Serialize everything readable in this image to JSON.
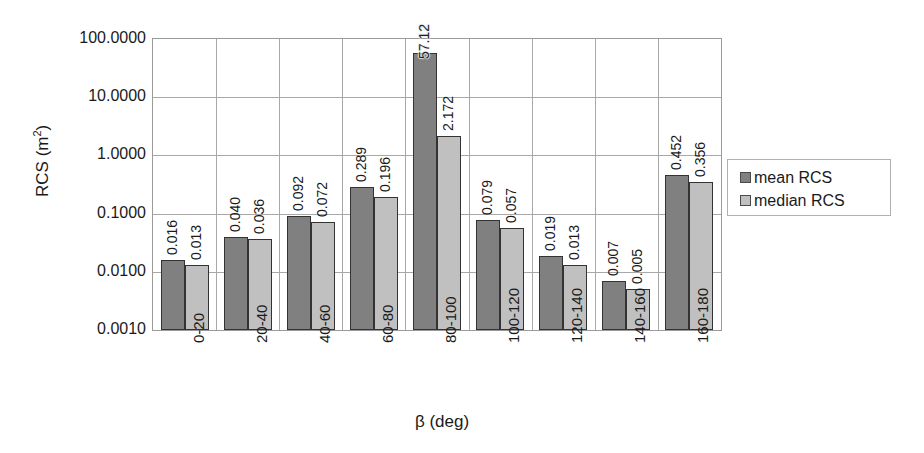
{
  "chart_data": {
    "type": "bar",
    "title": "",
    "xlabel": "β (deg)",
    "ylabel": "RCS (m²)",
    "ylabel_base": "RCS (m",
    "ylabel_sup": "2",
    "ylabel_tail": ")",
    "yscale": "log",
    "ylim": [
      0.001,
      100
    ],
    "grid": true,
    "legend_position": "right",
    "categories": [
      "0-20",
      "20-40",
      "40-60",
      "60-80",
      "80-100",
      "100-120",
      "120-140",
      "140-160",
      "160-180"
    ],
    "y_ticks": [
      "100.0000",
      "10.0000",
      "1.0000",
      "0.1000",
      "0.0100",
      "0.0010"
    ],
    "y_tick_values": [
      100,
      10,
      1,
      0.1,
      0.01,
      0.001
    ],
    "series": [
      {
        "name": "mean RCS",
        "color": "#808080",
        "values": [
          0.016,
          0.04,
          0.092,
          0.289,
          57.12,
          0.079,
          0.019,
          0.007,
          0.452
        ],
        "labels": [
          "0.016",
          "0.040",
          "0.092",
          "0.289",
          "57.12",
          "0.079",
          "0.019",
          "0.007",
          "0.452"
        ]
      },
      {
        "name": "median RCS",
        "color": "#c0c0c0",
        "values": [
          0.013,
          0.036,
          0.072,
          0.196,
          2.172,
          0.057,
          0.013,
          0.005,
          0.356
        ],
        "labels": [
          "0.013",
          "0.036",
          "0.072",
          "0.196",
          "2.172",
          "0.057",
          "0.013",
          "0.005",
          "0.356"
        ]
      }
    ]
  },
  "legend": {
    "items": [
      {
        "label": "mean RCS",
        "color": "#808080"
      },
      {
        "label": "median RCS",
        "color": "#c0c0c0"
      }
    ]
  },
  "colors": {
    "mean": "#808080",
    "median": "#c0c0c0",
    "grid": "#a8a8a8",
    "border": "#9a9a9a",
    "text": "#1a1a1a"
  }
}
